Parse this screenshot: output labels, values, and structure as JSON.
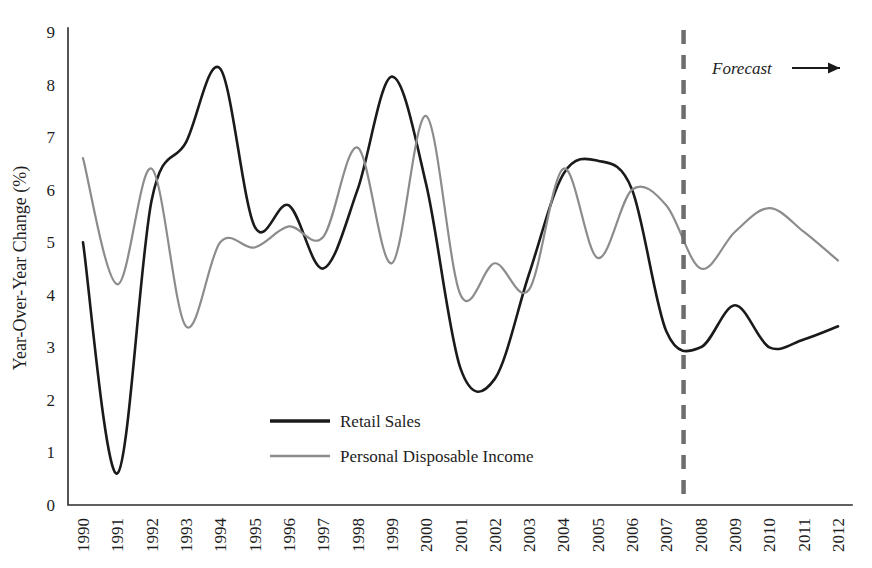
{
  "chart_data": {
    "type": "line",
    "title": "",
    "subtitle": "",
    "xlabel": "",
    "ylabel": "Year-Over-Year Change (%)",
    "xlim": [
      1990,
      2012
    ],
    "ylim": [
      0,
      9
    ],
    "yticks": [
      0,
      1,
      2,
      3,
      4,
      5,
      6,
      7,
      8,
      9
    ],
    "ytick_labels": [
      "0",
      "1",
      "2",
      "3",
      "4",
      "5",
      "6",
      "7",
      "8",
      "9"
    ],
    "x": [
      1990,
      1991,
      1992,
      1993,
      1994,
      1995,
      1996,
      1997,
      1998,
      1999,
      2000,
      2001,
      2002,
      2003,
      2004,
      2005,
      2006,
      2007,
      2008,
      2009,
      2010,
      2011,
      2012
    ],
    "xtick_labels": [
      "1990",
      "1991",
      "1992",
      "1993",
      "1994",
      "1995",
      "1996",
      "1997",
      "1998",
      "1999",
      "2000",
      "2001",
      "2002",
      "2003",
      "2004",
      "2005",
      "2006",
      "2007",
      "2008",
      "2009",
      "2010",
      "2011",
      "2012"
    ],
    "grid": false,
    "legend_position": "center-bottom-inside",
    "series": [
      {
        "name": "Retail Sales",
        "color": "#1a1a1a",
        "line_width": 2.6,
        "values": [
          5.0,
          0.6,
          5.8,
          6.9,
          8.3,
          5.3,
          5.7,
          4.5,
          6.0,
          8.15,
          6.1,
          2.6,
          2.4,
          4.4,
          6.3,
          6.55,
          6.0,
          3.3,
          3.0,
          3.8,
          3.0,
          3.15,
          3.4
        ]
      },
      {
        "name": "Personal Disposable Income",
        "color": "#8c8c8c",
        "line_width": 2.2,
        "values": [
          6.6,
          4.2,
          6.4,
          3.4,
          5.0,
          4.9,
          5.3,
          5.1,
          6.8,
          4.6,
          7.4,
          4.0,
          4.6,
          4.1,
          6.4,
          4.7,
          6.0,
          5.7,
          4.5,
          5.2,
          5.65,
          5.2,
          4.65
        ]
      }
    ],
    "annotations": [
      {
        "name": "forecast",
        "label": "Forecast",
        "divider_x": 2007.5,
        "divider_style": "dashed",
        "divider_color": "#6e6e6e",
        "arrow_direction": "right"
      }
    ]
  },
  "legend": {
    "items": [
      {
        "label": "Retail Sales",
        "color": "#1a1a1a"
      },
      {
        "label": "Personal Disposable Income",
        "color": "#8c8c8c"
      }
    ]
  },
  "axis": {
    "y_axis_title": "Year-Over-Year Change (%)"
  }
}
